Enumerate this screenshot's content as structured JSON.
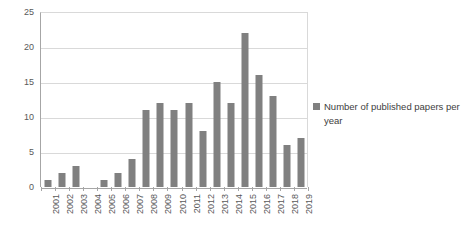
{
  "chart_data": {
    "type": "bar",
    "title": "",
    "xlabel": "",
    "ylabel": "",
    "ylim": [
      0,
      25
    ],
    "yticks": [
      0,
      5,
      10,
      15,
      20,
      25
    ],
    "grid": true,
    "legend_position": "right",
    "bar_color": "#808080",
    "gridline_color": "#d9d9d9",
    "axis_color": "#a6a6a6",
    "categories": [
      "2001",
      "2002",
      "2003",
      "2004",
      "2005",
      "2006",
      "2007",
      "2008",
      "2009",
      "2010",
      "2011",
      "2012",
      "2013",
      "2014",
      "2015",
      "2016",
      "2017",
      "2018",
      "2019"
    ],
    "series": [
      {
        "name": "Number of published papers per year",
        "values": [
          1,
          2,
          3,
          0,
          1,
          2,
          4,
          11,
          12,
          11,
          12,
          8,
          15,
          12,
          22,
          16,
          13,
          6,
          7
        ]
      }
    ]
  },
  "legend": {
    "entries": [
      {
        "label": "Number of published papers per year",
        "color": "#808080"
      }
    ]
  }
}
